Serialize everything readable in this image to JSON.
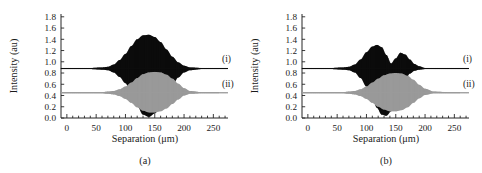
{
  "figure": {
    "panels": [
      {
        "caption": "(a)",
        "xlabel": "Separation (μm)",
        "ylabel": "Intensity (au)"
      },
      {
        "caption": "(b)",
        "xlabel": "Separation (μm)",
        "ylabel": "Intensity (au)"
      }
    ],
    "curve_labels": {
      "upper": "(i)",
      "lower": "(ii)"
    },
    "colors": {
      "trace_dark": "#0d0d0d",
      "trace_gray": "#9a9a9a",
      "axis": "#262626",
      "background": "#ffffff"
    }
  },
  "chart_data": [
    {
      "type": "line",
      "title": "(a)",
      "xlabel": "Separation (μm)",
      "ylabel": "Intensity (au)",
      "xlim": [
        -10,
        275
      ],
      "ylim": [
        0.0,
        1.85
      ],
      "xticks": [
        0,
        50,
        100,
        150,
        200,
        250
      ],
      "yticks": [
        0.0,
        0.2,
        0.4,
        0.6,
        0.8,
        1.0,
        1.2,
        1.4,
        1.6,
        1.8
      ],
      "grid": false,
      "legend_position": "right-inline",
      "series": [
        {
          "name": "(i)",
          "color": "#0d0d0d",
          "description": "Interferogram fringe envelope, single lobe",
          "baseline": 0.88,
          "envelope_center": 138,
          "envelope_width": 52,
          "peak_upper": 1.48,
          "peak_lower": 0.02,
          "x": [
            0,
            20,
            40,
            60,
            70,
            80,
            90,
            100,
            110,
            120,
            130,
            140,
            150,
            160,
            170,
            180,
            190,
            200,
            210,
            230,
            250,
            270
          ],
          "upper": [
            0.89,
            0.89,
            0.89,
            0.9,
            0.91,
            0.95,
            1.03,
            1.14,
            1.28,
            1.4,
            1.47,
            1.48,
            1.44,
            1.35,
            1.22,
            1.09,
            0.99,
            0.93,
            0.9,
            0.89,
            0.89,
            0.89
          ],
          "lower": [
            0.87,
            0.87,
            0.87,
            0.86,
            0.85,
            0.81,
            0.73,
            0.62,
            0.44,
            0.22,
            0.06,
            0.02,
            0.08,
            0.22,
            0.4,
            0.58,
            0.72,
            0.81,
            0.85,
            0.87,
            0.87,
            0.87
          ]
        },
        {
          "name": "(ii)",
          "color": "#9a9a9a",
          "description": "Interferogram fringe envelope, single lobe, lower baseline",
          "baseline": 0.45,
          "envelope_center": 152,
          "envelope_width": 44,
          "peak_upper": 0.82,
          "peak_lower": 0.1,
          "x": [
            0,
            20,
            40,
            60,
            70,
            80,
            90,
            100,
            110,
            120,
            130,
            140,
            150,
            160,
            170,
            180,
            190,
            200,
            210,
            230,
            250,
            270
          ],
          "upper": [
            0.46,
            0.46,
            0.46,
            0.46,
            0.47,
            0.48,
            0.51,
            0.56,
            0.63,
            0.71,
            0.78,
            0.81,
            0.82,
            0.81,
            0.77,
            0.7,
            0.61,
            0.53,
            0.48,
            0.46,
            0.46,
            0.46
          ],
          "lower": [
            0.44,
            0.44,
            0.44,
            0.44,
            0.43,
            0.42,
            0.39,
            0.34,
            0.27,
            0.19,
            0.13,
            0.1,
            0.1,
            0.12,
            0.17,
            0.25,
            0.33,
            0.4,
            0.43,
            0.44,
            0.44,
            0.44
          ]
        }
      ]
    },
    {
      "type": "line",
      "title": "(b)",
      "xlabel": "Separation (μm)",
      "ylabel": "Intensity (au)",
      "xlim": [
        -10,
        275
      ],
      "ylim": [
        0.0,
        1.85
      ],
      "xticks": [
        0,
        50,
        100,
        150,
        200,
        250
      ],
      "yticks": [
        0.0,
        0.2,
        0.4,
        0.6,
        0.8,
        1.0,
        1.2,
        1.4,
        1.6,
        1.8
      ],
      "grid": false,
      "legend_position": "right-inline",
      "series": [
        {
          "name": "(i)",
          "color": "#0d0d0d",
          "description": "Interferogram fringe envelope, split into two lobes with central notch",
          "baseline": 0.88,
          "lobe_centers": [
            120,
            158
          ],
          "peak_upper_first": 1.3,
          "peak_upper_second": 1.16,
          "notch_x": 143,
          "peak_lower": 0.04,
          "x": [
            0,
            20,
            40,
            60,
            70,
            80,
            90,
            100,
            110,
            118,
            126,
            134,
            142,
            150,
            158,
            166,
            174,
            182,
            190,
            200,
            215,
            240,
            270
          ],
          "upper": [
            0.89,
            0.89,
            0.89,
            0.9,
            0.91,
            0.95,
            1.04,
            1.17,
            1.27,
            1.3,
            1.26,
            1.12,
            0.97,
            1.06,
            1.16,
            1.13,
            1.04,
            0.96,
            0.92,
            0.89,
            0.89,
            0.89,
            0.89
          ],
          "lower": [
            0.87,
            0.87,
            0.87,
            0.86,
            0.85,
            0.81,
            0.71,
            0.56,
            0.36,
            0.18,
            0.06,
            0.04,
            0.12,
            0.3,
            0.52,
            0.68,
            0.79,
            0.84,
            0.86,
            0.87,
            0.87,
            0.87,
            0.87
          ]
        },
        {
          "name": "(ii)",
          "color": "#9a9a9a",
          "description": "Interferogram fringe envelope, single broad lobe, lower baseline",
          "baseline": 0.45,
          "envelope_center": 155,
          "envelope_width": 46,
          "peak_upper": 0.8,
          "peak_lower": 0.12,
          "x": [
            0,
            20,
            40,
            60,
            70,
            80,
            90,
            100,
            110,
            120,
            130,
            140,
            150,
            160,
            170,
            180,
            190,
            200,
            215,
            240,
            270
          ],
          "upper": [
            0.46,
            0.46,
            0.46,
            0.46,
            0.47,
            0.48,
            0.51,
            0.56,
            0.63,
            0.7,
            0.76,
            0.79,
            0.8,
            0.79,
            0.75,
            0.68,
            0.59,
            0.52,
            0.47,
            0.46,
            0.46
          ],
          "lower": [
            0.44,
            0.44,
            0.44,
            0.44,
            0.43,
            0.42,
            0.39,
            0.34,
            0.27,
            0.2,
            0.15,
            0.12,
            0.12,
            0.14,
            0.19,
            0.27,
            0.35,
            0.41,
            0.44,
            0.44,
            0.44
          ]
        }
      ]
    }
  ]
}
